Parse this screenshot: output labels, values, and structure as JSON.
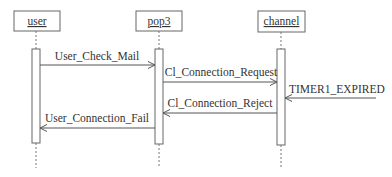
{
  "diagram": {
    "type": "sequence",
    "colors": {
      "line": "#555555",
      "text": "#333333",
      "background": "#ffffff"
    },
    "objects": [
      {
        "id": "user",
        "label": "user",
        "x": 36
      },
      {
        "id": "pop3",
        "label": "pop3",
        "x": 159
      },
      {
        "id": "channel",
        "label": "channel",
        "x": 281
      }
    ],
    "messages": [
      {
        "label": "User_Check_Mail",
        "from": "user",
        "to": "pop3",
        "y": 65
      },
      {
        "label": "Cl_Connection_Request",
        "from": "pop3",
        "to": "channel",
        "y": 82
      },
      {
        "label": "TIMER1_EXPIRED",
        "from": "external",
        "to": "channel",
        "y": 98
      },
      {
        "label": "Cl_Connection_Reject",
        "from": "channel",
        "to": "pop3",
        "y": 113
      },
      {
        "label": "User_Connection_Fail",
        "from": "pop3",
        "to": "user",
        "y": 128
      }
    ]
  }
}
